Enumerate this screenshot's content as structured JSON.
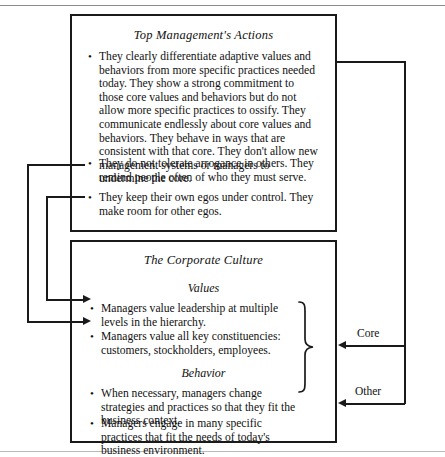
{
  "figure": {
    "top_box": {
      "title": "Top Management's Actions",
      "bullets": [
        "They clearly differentiate adaptive values and behaviors from more specific practices needed today. They show a strong commitment to those core values and behaviors but do not allow more specific practices to ossify.  They communicate endlessly about core values and behaviors.  They behave in ways that are consistent with that core. They don't allow new management systems or managers to undermine the core.",
        "They do not tolerate arrogance in others. They remind people often of who they must serve.",
        "They keep their own egos under control.  They make room for other egos."
      ]
    },
    "bottom_box": {
      "title": "The Corporate Culture",
      "sections": [
        {
          "heading": "Values",
          "bullets": [
            "Managers value leadership at multiple levels in the hierarchy.",
            "Managers value all key constituencies: customers, stockholders, employees."
          ]
        },
        {
          "heading": "Behavior",
          "bullets": [
            "When necessary, managers change strategies and practices so that they fit the business context.",
            "Managers engage in many specific practices that fit the needs of today's business environment."
          ]
        }
      ]
    },
    "side_labels": {
      "core": "Core",
      "other": "Other"
    },
    "bullet_glyph": "•"
  }
}
